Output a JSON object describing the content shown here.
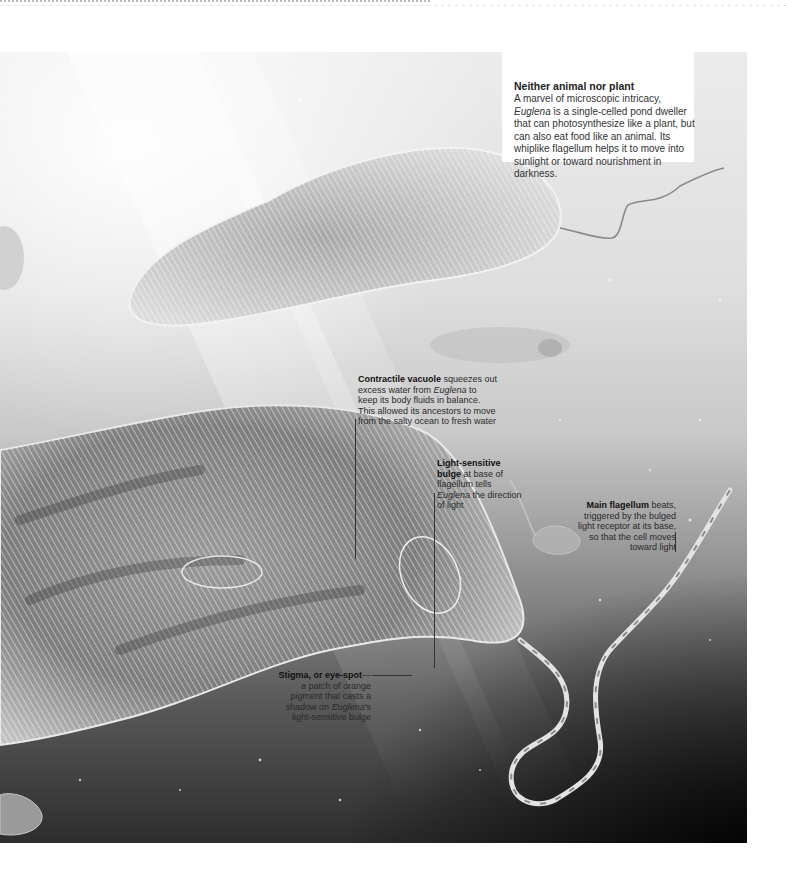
{
  "intro": {
    "title": "Neither animal nor plant",
    "body_pre": "A marvel of microscopic intricacy, ",
    "body_em": "Euglena",
    "body_post": " is a single-celled pond dweller that can photosynthesize like a plant, but can also eat food like an animal. Its whiplike flagellum helps it to move into sunlight or toward nourishment in darkness."
  },
  "callouts": {
    "contractile_vacuole": {
      "title": "Contractile vacuole",
      "text_pre": " squeezes out excess water from ",
      "text_em": "Euglena",
      "text_post": " to keep its body fluids in balance. This allowed its ancestors to move from the salty ocean to fresh water"
    },
    "light_bulge": {
      "title": "Light-sensitive bulge",
      "text_pre": " at base of flagellum tells ",
      "text_em": "Euglena",
      "text_post": " the direction of light"
    },
    "main_flagellum": {
      "title": "Main flagellum",
      "text": " beats, triggered by the bulged light receptor at its base, so that the cell moves toward light"
    },
    "stigma": {
      "title": "Stigma, or eye-spot",
      "text_pre": "—a patch of orange pigment that casts a shadow on ",
      "text_em": "Euglena",
      "text_post": "’s light-sensitive bulge"
    }
  },
  "colors": {
    "panel_light": "#ececec",
    "panel_dark": "#000000",
    "text": "#222222",
    "box": "#ffffff"
  }
}
